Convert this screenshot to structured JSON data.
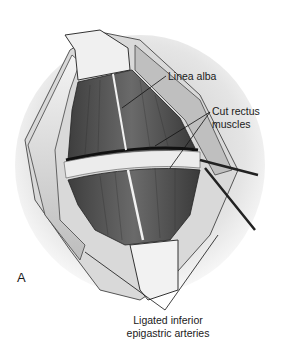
{
  "figure": {
    "panel_letter": "A",
    "labels": {
      "linea_alba": "Linea alba",
      "cut_rectus_line1": "Cut rectus",
      "cut_rectus_line2": "muscles",
      "ligated_line1": "Ligated inferior",
      "ligated_line2": "epigastric arteries"
    },
    "colors": {
      "background": "#ffffff",
      "skin_shadow": "#c8c8c8",
      "muscle_dark": "#4a4a4a",
      "muscle_mid": "#6e6e6e",
      "fascia_light": "#e6e6e6",
      "leader_line": "#111111"
    }
  }
}
